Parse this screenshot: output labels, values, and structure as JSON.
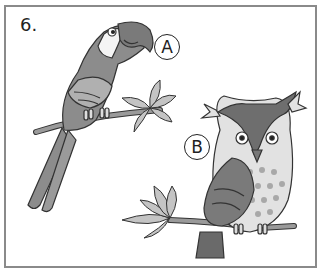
{
  "question": {
    "number": "6."
  },
  "options": [
    {
      "label": "A",
      "animal": "parrot"
    },
    {
      "label": "B",
      "animal": "owl"
    }
  ],
  "colors": {
    "frame": "#8a8a8a",
    "ink": "#222222",
    "bird_gray": "#8c8c8c",
    "light_gray": "#c8c8c8"
  }
}
